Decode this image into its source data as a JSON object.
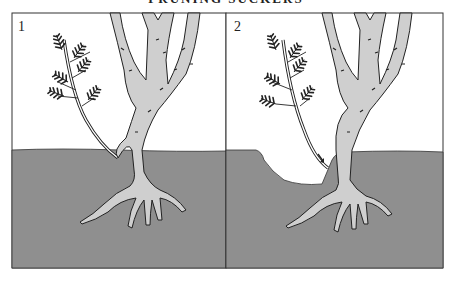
{
  "header": {
    "title": "PRUNING SUCKERS"
  },
  "panels": [
    {
      "number": "1",
      "description": "Sucker growing from rootstock below soil level"
    },
    {
      "number": "2",
      "description": "Soil removed to expose sucker base; arrow marks point of removal"
    }
  ],
  "colors": {
    "soil": "#8f8f8f",
    "plant": "#cfcfcf",
    "outline": "#222222",
    "background": "#ffffff"
  }
}
